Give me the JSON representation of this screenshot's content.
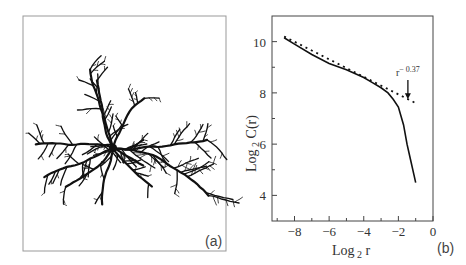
{
  "chart_data": [
    {
      "type": "image",
      "panel_label": "(a)",
      "description": "Dendritic fractal cluster (diffusion-limited aggregation-like) with about nine main branches radiating from center"
    },
    {
      "type": "line",
      "panel_label": "(b)",
      "title": "",
      "xlabel": "Log",
      "xlabel_sub": "2",
      "xlabel_tail": " r",
      "ylabel": "Log",
      "ylabel_sub": "2",
      "ylabel_tail": " C(r)",
      "xlim": [
        -9.3,
        0
      ],
      "ylim": [
        3,
        11
      ],
      "xticks": [
        -8,
        -6,
        -4,
        -2,
        0
      ],
      "xtick_labels": [
        "-8",
        "-6",
        "-4",
        "-2",
        "0"
      ],
      "xminor": [
        -9,
        -7,
        -5,
        -3,
        -1
      ],
      "yticks": [
        4,
        6,
        8,
        10
      ],
      "ytick_labels": [
        "4",
        "6",
        "8",
        "10"
      ],
      "yminor": [
        5,
        7,
        9
      ],
      "grid": false,
      "series": [
        {
          "name": "measured",
          "style": "solid",
          "x": [
            -8.6,
            -8.0,
            -7.0,
            -6.0,
            -5.0,
            -4.0,
            -3.5,
            -3.0,
            -2.6,
            -2.3,
            -2.0,
            -1.7,
            -1.5,
            -1.3,
            -1.1,
            -1.0
          ],
          "y": [
            10.15,
            9.9,
            9.5,
            9.15,
            8.9,
            8.6,
            8.4,
            8.2,
            8.0,
            7.75,
            7.45,
            6.75,
            6.0,
            5.4,
            4.8,
            4.5
          ]
        },
        {
          "name": "power-law fit",
          "style": "dotted",
          "x": [
            -8.6,
            -1.0
          ],
          "y": [
            10.2,
            7.6
          ]
        }
      ],
      "annotations": [
        {
          "text": "r",
          "superscript": "− 0.37",
          "x": -1.45,
          "y": 8.5,
          "arrow_to": [
            -1.45,
            7.75
          ]
        }
      ]
    }
  ]
}
